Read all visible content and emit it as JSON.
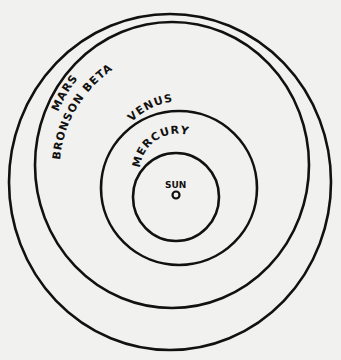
{
  "diagram": {
    "background": "#f1f1ef",
    "stroke": "#111111",
    "orbits": [
      {
        "name": "Mars",
        "label": "MARS",
        "cx": 170,
        "cy": 182,
        "rx": 161,
        "ry": 168
      },
      {
        "name": "Bronson Beta",
        "label": "BRONSON BETA",
        "cx": 172,
        "cy": 165,
        "rx": 137,
        "ry": 143
      },
      {
        "name": "Venus",
        "label": "VENUS",
        "cx": 179,
        "cy": 188,
        "rx": 78,
        "ry": 77
      },
      {
        "name": "Mercury",
        "label": "MERCURY",
        "cx": 176,
        "cy": 197,
        "rx": 43,
        "ry": 44
      }
    ],
    "sun": {
      "label": "SUN",
      "cx": 176,
      "cy": 195,
      "r": 3.5
    }
  }
}
